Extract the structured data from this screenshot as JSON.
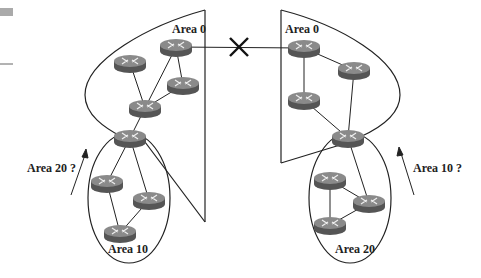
{
  "diagram": {
    "labels": {
      "left_area0": "Area 0",
      "right_area0": "Area 0",
      "left_area10": "Area 10",
      "right_area20": "Area 20",
      "left_question": "Area 20 ?",
      "right_question": "Area 10 ?"
    },
    "colors": {
      "line": "#222222",
      "router_top": "#8a8a8a",
      "router_side": "#555555",
      "corner_block": "#aaaaaa"
    },
    "icons": {
      "router": "router-icon",
      "broken_link": "x-mark-icon",
      "arrow": "arrow-icon"
    }
  }
}
